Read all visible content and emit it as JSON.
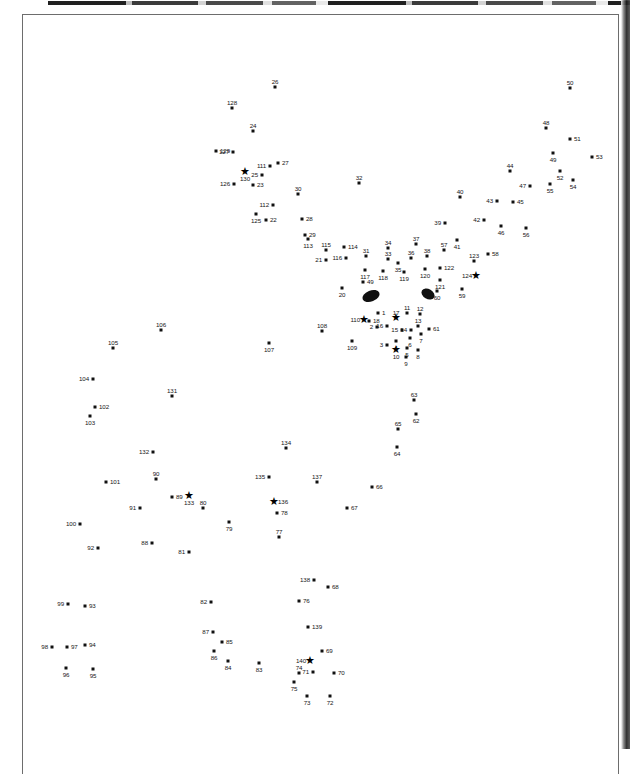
{
  "document": {
    "type": "scanned-figure-page",
    "figure_kind": "landmark-scatter",
    "background_color": "#ffffff",
    "marker_color": "#111111",
    "label_color": "#161616",
    "frame_color": "#6d6d6d"
  },
  "chart_data": {
    "type": "scatter",
    "title": "",
    "subtitle": "",
    "xlabel": "",
    "ylabel": "",
    "grid": false,
    "legend": null,
    "axis_visible": false,
    "xlim": [
      0,
      630
    ],
    "ylim": [
      749,
      0
    ],
    "point_count": 140,
    "marker_shapes": [
      "square-dot",
      "star"
    ],
    "annotations": [
      {
        "name": "left-eye-blob",
        "shape": "ellipse",
        "cx": 371,
        "cy": 296,
        "rx": 9,
        "ry": 5.5,
        "rotation": -22,
        "fill": "#101010"
      },
      {
        "name": "right-eye-blob",
        "shape": "ellipse",
        "cx": 428,
        "cy": 294,
        "rx": 7,
        "ry": 5,
        "rotation": 30,
        "fill": "#101010"
      }
    ],
    "points": [
      {
        "label": "26",
        "x": 275,
        "y": 87,
        "marker": "dot",
        "lp": "top"
      },
      {
        "label": "50",
        "x": 570,
        "y": 88,
        "marker": "dot",
        "lp": "top"
      },
      {
        "label": "128",
        "x": 232,
        "y": 108,
        "marker": "dot",
        "lp": "top"
      },
      {
        "label": "48",
        "x": 546,
        "y": 128,
        "marker": "dot",
        "lp": "top"
      },
      {
        "label": "24",
        "x": 253,
        "y": 131,
        "marker": "dot",
        "lp": "top"
      },
      {
        "label": "51",
        "x": 570,
        "y": 139,
        "marker": "dot",
        "lp": "right"
      },
      {
        "label": "129",
        "x": 216,
        "y": 151,
        "marker": "dot",
        "lp": "right"
      },
      {
        "label": "127",
        "x": 233,
        "y": 152,
        "marker": "dot",
        "lp": "left"
      },
      {
        "label": "49",
        "x": 553,
        "y": 153,
        "marker": "dot",
        "lp": "bottom"
      },
      {
        "label": "53",
        "x": 592,
        "y": 157,
        "marker": "dot",
        "lp": "right"
      },
      {
        "label": "27",
        "x": 278,
        "y": 163,
        "marker": "dot",
        "lp": "right"
      },
      {
        "label": "111",
        "x": 270,
        "y": 166,
        "marker": "dot",
        "lp": "left"
      },
      {
        "label": "44",
        "x": 510,
        "y": 171,
        "marker": "dot",
        "lp": "top"
      },
      {
        "label": "52",
        "x": 560,
        "y": 171,
        "marker": "dot",
        "lp": "bottom"
      },
      {
        "label": "25",
        "x": 262,
        "y": 175,
        "marker": "dot",
        "lp": "left"
      },
      {
        "label": "130",
        "x": 245,
        "y": 172,
        "marker": "star",
        "lp": "bottom"
      },
      {
        "label": "55",
        "x": 550,
        "y": 184,
        "marker": "dot",
        "lp": "bottom"
      },
      {
        "label": "54",
        "x": 573,
        "y": 180,
        "marker": "dot",
        "lp": "bottom"
      },
      {
        "label": "47",
        "x": 530,
        "y": 186,
        "marker": "dot",
        "lp": "left"
      },
      {
        "label": "23",
        "x": 253,
        "y": 185,
        "marker": "dot",
        "lp": "right"
      },
      {
        "label": "126",
        "x": 234,
        "y": 184,
        "marker": "dot",
        "lp": "left"
      },
      {
        "label": "30",
        "x": 298,
        "y": 194,
        "marker": "dot",
        "lp": "top"
      },
      {
        "label": "32",
        "x": 359,
        "y": 183,
        "marker": "dot",
        "lp": "top"
      },
      {
        "label": "40",
        "x": 460,
        "y": 197,
        "marker": "dot",
        "lp": "top"
      },
      {
        "label": "43",
        "x": 497,
        "y": 201,
        "marker": "dot",
        "lp": "left"
      },
      {
        "label": "45",
        "x": 513,
        "y": 202,
        "marker": "dot",
        "lp": "right"
      },
      {
        "label": "112",
        "x": 273,
        "y": 205,
        "marker": "dot",
        "lp": "left"
      },
      {
        "label": "125",
        "x": 256,
        "y": 214,
        "marker": "dot",
        "lp": "bottom"
      },
      {
        "label": "22",
        "x": 266,
        "y": 220,
        "marker": "dot",
        "lp": "right"
      },
      {
        "label": "42",
        "x": 484,
        "y": 220,
        "marker": "dot",
        "lp": "left"
      },
      {
        "label": "46",
        "x": 501,
        "y": 226,
        "marker": "dot",
        "lp": "bottom"
      },
      {
        "label": "56",
        "x": 526,
        "y": 228,
        "marker": "dot",
        "lp": "bottom"
      },
      {
        "label": "28",
        "x": 302,
        "y": 219,
        "marker": "dot",
        "lp": "right"
      },
      {
        "label": "39",
        "x": 445,
        "y": 223,
        "marker": "dot",
        "lp": "left"
      },
      {
        "label": "41",
        "x": 457,
        "y": 240,
        "marker": "dot",
        "lp": "bottom"
      },
      {
        "label": "29",
        "x": 305,
        "y": 235,
        "marker": "dot",
        "lp": "right"
      },
      {
        "label": "113",
        "x": 308,
        "y": 239,
        "marker": "dot",
        "lp": "bottom"
      },
      {
        "label": "34",
        "x": 388,
        "y": 248,
        "marker": "dot",
        "lp": "top"
      },
      {
        "label": "37",
        "x": 416,
        "y": 244,
        "marker": "dot",
        "lp": "top"
      },
      {
        "label": "115",
        "x": 326,
        "y": 250,
        "marker": "dot",
        "lp": "top"
      },
      {
        "label": "114",
        "x": 344,
        "y": 247,
        "marker": "dot",
        "lp": "right"
      },
      {
        "label": "57",
        "x": 444,
        "y": 250,
        "marker": "dot",
        "lp": "top"
      },
      {
        "label": "58",
        "x": 488,
        "y": 254,
        "marker": "dot",
        "lp": "right"
      },
      {
        "label": "123",
        "x": 474,
        "y": 261,
        "marker": "dot",
        "lp": "top"
      },
      {
        "label": "116",
        "x": 346,
        "y": 258,
        "marker": "dot",
        "lp": "left"
      },
      {
        "label": "31",
        "x": 366,
        "y": 256,
        "marker": "dot",
        "lp": "top"
      },
      {
        "label": "21",
        "x": 326,
        "y": 260,
        "marker": "dot",
        "lp": "left"
      },
      {
        "label": "33",
        "x": 388,
        "y": 259,
        "marker": "dot",
        "lp": "top"
      },
      {
        "label": "36",
        "x": 411,
        "y": 258,
        "marker": "dot",
        "lp": "top"
      },
      {
        "label": "38",
        "x": 427,
        "y": 256,
        "marker": "dot",
        "lp": "top"
      },
      {
        "label": "35",
        "x": 398,
        "y": 263,
        "marker": "dot",
        "lp": "bottom"
      },
      {
        "label": "120",
        "x": 425,
        "y": 269,
        "marker": "dot",
        "lp": "bottom"
      },
      {
        "label": "122",
        "x": 440,
        "y": 268,
        "marker": "dot",
        "lp": "right"
      },
      {
        "label": "124",
        "x": 476,
        "y": 276,
        "marker": "star",
        "lp": "left"
      },
      {
        "label": "118",
        "x": 383,
        "y": 271,
        "marker": "dot",
        "lp": "bottom"
      },
      {
        "label": "119",
        "x": 404,
        "y": 272,
        "marker": "dot",
        "lp": "bottom"
      },
      {
        "label": "117",
        "x": 365,
        "y": 270,
        "marker": "dot",
        "lp": "bottom"
      },
      {
        "label": "121",
        "x": 440,
        "y": 280,
        "marker": "dot",
        "lp": "bottom"
      },
      {
        "label": "49b",
        "x": 363,
        "y": 282,
        "marker": "dot",
        "lp": "right"
      },
      {
        "label": "20",
        "x": 342,
        "y": 288,
        "marker": "dot",
        "lp": "bottom"
      },
      {
        "label": "60",
        "x": 437,
        "y": 291,
        "marker": "dot",
        "lp": "bottom"
      },
      {
        "label": "59",
        "x": 462,
        "y": 289,
        "marker": "dot",
        "lp": "bottom"
      },
      {
        "label": "110",
        "x": 364,
        "y": 320,
        "marker": "star",
        "lp": "left"
      },
      {
        "label": "18",
        "x": 369,
        "y": 321,
        "marker": "dot",
        "lp": "right"
      },
      {
        "label": "1",
        "x": 378,
        "y": 313,
        "marker": "dot",
        "lp": "right"
      },
      {
        "label": "17",
        "x": 396,
        "y": 318,
        "marker": "star",
        "lp": "top"
      },
      {
        "label": "11",
        "x": 407,
        "y": 313,
        "marker": "dot",
        "lp": "top"
      },
      {
        "label": "12",
        "x": 420,
        "y": 314,
        "marker": "dot",
        "lp": "top"
      },
      {
        "label": "108",
        "x": 322,
        "y": 331,
        "marker": "dot",
        "lp": "top"
      },
      {
        "label": "2",
        "x": 377,
        "y": 327,
        "marker": "dot",
        "lp": "left"
      },
      {
        "label": "16",
        "x": 387,
        "y": 326,
        "marker": "dot",
        "lp": "left"
      },
      {
        "label": "15",
        "x": 402,
        "y": 330,
        "marker": "dot",
        "lp": "left"
      },
      {
        "label": "14",
        "x": 411,
        "y": 330,
        "marker": "dot",
        "lp": "left"
      },
      {
        "label": "13",
        "x": 418,
        "y": 326,
        "marker": "dot",
        "lp": "top"
      },
      {
        "label": "61",
        "x": 429,
        "y": 329,
        "marker": "dot",
        "lp": "right"
      },
      {
        "label": "7",
        "x": 421,
        "y": 334,
        "marker": "dot",
        "lp": "bottom"
      },
      {
        "label": "109",
        "x": 352,
        "y": 341,
        "marker": "dot",
        "lp": "bottom"
      },
      {
        "label": "3",
        "x": 387,
        "y": 345,
        "marker": "dot",
        "lp": "left"
      },
      {
        "label": "4",
        "x": 396,
        "y": 341,
        "marker": "dot",
        "lp": "bottom"
      },
      {
        "label": "6",
        "x": 410,
        "y": 338,
        "marker": "dot",
        "lp": "bottom"
      },
      {
        "label": "5",
        "x": 407,
        "y": 348,
        "marker": "dot",
        "lp": "bottom"
      },
      {
        "label": "8",
        "x": 418,
        "y": 350,
        "marker": "dot",
        "lp": "bottom"
      },
      {
        "label": "10",
        "x": 396,
        "y": 350,
        "marker": "star",
        "lp": "bottom"
      },
      {
        "label": "9",
        "x": 406,
        "y": 357,
        "marker": "dot",
        "lp": "bottom"
      },
      {
        "label": "107",
        "x": 269,
        "y": 343,
        "marker": "dot",
        "lp": "bottom"
      },
      {
        "label": "106",
        "x": 161,
        "y": 330,
        "marker": "dot",
        "lp": "top"
      },
      {
        "label": "105",
        "x": 113,
        "y": 348,
        "marker": "dot",
        "lp": "top"
      },
      {
        "label": "104",
        "x": 93,
        "y": 379,
        "marker": "dot",
        "lp": "left"
      },
      {
        "label": "131",
        "x": 172,
        "y": 396,
        "marker": "dot",
        "lp": "top"
      },
      {
        "label": "102",
        "x": 95,
        "y": 407,
        "marker": "dot",
        "lp": "right"
      },
      {
        "label": "103",
        "x": 90,
        "y": 416,
        "marker": "dot",
        "lp": "bottom"
      },
      {
        "label": "63",
        "x": 414,
        "y": 400,
        "marker": "dot",
        "lp": "top"
      },
      {
        "label": "62",
        "x": 416,
        "y": 414,
        "marker": "dot",
        "lp": "bottom"
      },
      {
        "label": "65",
        "x": 398,
        "y": 429,
        "marker": "dot",
        "lp": "top"
      },
      {
        "label": "64",
        "x": 397,
        "y": 447,
        "marker": "dot",
        "lp": "bottom"
      },
      {
        "label": "132",
        "x": 153,
        "y": 452,
        "marker": "dot",
        "lp": "left"
      },
      {
        "label": "134",
        "x": 286,
        "y": 448,
        "marker": "dot",
        "lp": "top"
      },
      {
        "label": "90",
        "x": 156,
        "y": 479,
        "marker": "dot",
        "lp": "top"
      },
      {
        "label": "135",
        "x": 269,
        "y": 477,
        "marker": "dot",
        "lp": "left"
      },
      {
        "label": "137",
        "x": 317,
        "y": 482,
        "marker": "dot",
        "lp": "top"
      },
      {
        "label": "101",
        "x": 106,
        "y": 482,
        "marker": "dot",
        "lp": "right"
      },
      {
        "label": "89",
        "x": 172,
        "y": 497,
        "marker": "dot",
        "lp": "right"
      },
      {
        "label": "133",
        "x": 189,
        "y": 496,
        "marker": "star",
        "lp": "bottom"
      },
      {
        "label": "66",
        "x": 372,
        "y": 487,
        "marker": "dot",
        "lp": "right"
      },
      {
        "label": "136",
        "x": 274,
        "y": 502,
        "marker": "star",
        "lp": "right"
      },
      {
        "label": "80",
        "x": 203,
        "y": 508,
        "marker": "dot",
        "lp": "top"
      },
      {
        "label": "91",
        "x": 140,
        "y": 508,
        "marker": "dot",
        "lp": "left"
      },
      {
        "label": "78",
        "x": 277,
        "y": 513,
        "marker": "dot",
        "lp": "right"
      },
      {
        "label": "67",
        "x": 347,
        "y": 508,
        "marker": "dot",
        "lp": "right"
      },
      {
        "label": "79",
        "x": 229,
        "y": 522,
        "marker": "dot",
        "lp": "bottom"
      },
      {
        "label": "100",
        "x": 80,
        "y": 524,
        "marker": "dot",
        "lp": "left"
      },
      {
        "label": "88",
        "x": 152,
        "y": 543,
        "marker": "dot",
        "lp": "left"
      },
      {
        "label": "81",
        "x": 189,
        "y": 552,
        "marker": "dot",
        "lp": "left"
      },
      {
        "label": "77",
        "x": 279,
        "y": 537,
        "marker": "dot",
        "lp": "top"
      },
      {
        "label": "92",
        "x": 98,
        "y": 548,
        "marker": "dot",
        "lp": "left"
      },
      {
        "label": "138",
        "x": 314,
        "y": 580,
        "marker": "dot",
        "lp": "left"
      },
      {
        "label": "68",
        "x": 328,
        "y": 587,
        "marker": "dot",
        "lp": "right"
      },
      {
        "label": "76",
        "x": 299,
        "y": 601,
        "marker": "dot",
        "lp": "right"
      },
      {
        "label": "99",
        "x": 68,
        "y": 604,
        "marker": "dot",
        "lp": "left"
      },
      {
        "label": "93",
        "x": 85,
        "y": 606,
        "marker": "dot",
        "lp": "right"
      },
      {
        "label": "82",
        "x": 211,
        "y": 602,
        "marker": "dot",
        "lp": "left"
      },
      {
        "label": "139",
        "x": 308,
        "y": 627,
        "marker": "dot",
        "lp": "right"
      },
      {
        "label": "87",
        "x": 213,
        "y": 632,
        "marker": "dot",
        "lp": "left"
      },
      {
        "label": "85",
        "x": 222,
        "y": 642,
        "marker": "dot",
        "lp": "right"
      },
      {
        "label": "98",
        "x": 52,
        "y": 647,
        "marker": "dot",
        "lp": "left"
      },
      {
        "label": "97",
        "x": 67,
        "y": 647,
        "marker": "dot",
        "lp": "right"
      },
      {
        "label": "94",
        "x": 85,
        "y": 645,
        "marker": "dot",
        "lp": "right"
      },
      {
        "label": "86",
        "x": 214,
        "y": 651,
        "marker": "dot",
        "lp": "bottom"
      },
      {
        "label": "84",
        "x": 228,
        "y": 661,
        "marker": "dot",
        "lp": "bottom"
      },
      {
        "label": "83",
        "x": 259,
        "y": 663,
        "marker": "dot",
        "lp": "bottom"
      },
      {
        "label": "69",
        "x": 322,
        "y": 651,
        "marker": "dot",
        "lp": "right"
      },
      {
        "label": "140",
        "x": 310,
        "y": 661,
        "marker": "star",
        "lp": "left"
      },
      {
        "label": "71",
        "x": 313,
        "y": 672,
        "marker": "dot",
        "lp": "left"
      },
      {
        "label": "70",
        "x": 334,
        "y": 673,
        "marker": "dot",
        "lp": "right"
      },
      {
        "label": "74",
        "x": 299,
        "y": 673,
        "marker": "dot",
        "lp": "top"
      },
      {
        "label": "96",
        "x": 66,
        "y": 668,
        "marker": "dot",
        "lp": "bottom"
      },
      {
        "label": "95",
        "x": 93,
        "y": 669,
        "marker": "dot",
        "lp": "bottom"
      },
      {
        "label": "75",
        "x": 294,
        "y": 682,
        "marker": "dot",
        "lp": "bottom"
      },
      {
        "label": "73",
        "x": 307,
        "y": 696,
        "marker": "dot",
        "lp": "bottom"
      },
      {
        "label": "72",
        "x": 330,
        "y": 696,
        "marker": "dot",
        "lp": "bottom"
      }
    ]
  }
}
